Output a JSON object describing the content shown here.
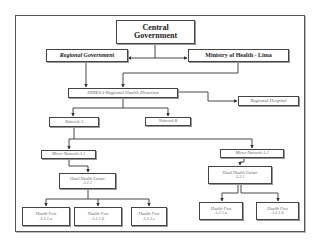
{
  "diagram": {
    "type": "organizational-hierarchy",
    "nodes": {
      "central_government": {
        "line1": "Central",
        "line2": "Government"
      },
      "regional_government": {
        "label": "Regional Government"
      },
      "ministry_of_health": {
        "label": "Ministry of Health - Lima"
      },
      "diresa": {
        "label": "DIRESA-Regional Health Direction"
      },
      "regional_hospital": {
        "label": "Regional Hospital"
      },
      "network_a": {
        "label": "Network A"
      },
      "network_b": {
        "label": "Network B"
      },
      "micro_network_a1": {
        "label": "Micro-Network A.1"
      },
      "micro_network_a2": {
        "label": "Micro-Network A.2"
      },
      "head_health_center_a11": {
        "line1": "Head Health Center",
        "line2": "A.1.1"
      },
      "head_health_center_a21": {
        "line1": "Head Health Center",
        "line2": "A.2.1"
      },
      "health_post_a11a": {
        "line1": "Health Post",
        "line2": "A.1.1.a"
      },
      "health_post_a11b": {
        "line1": "Health Post",
        "line2": "A.1.1.b"
      },
      "health_post_a11c": {
        "line1": "Health Post",
        "line2": "A.1.1.c"
      },
      "health_post_a21a": {
        "line1": "Health Post",
        "line2": "A.2.1.a"
      },
      "health_post_a21b": {
        "line1": "Health Post",
        "line2": "A.2.1.b"
      }
    },
    "edges": [
      [
        "central_government",
        "regional_government"
      ],
      [
        "central_government",
        "ministry_of_health"
      ],
      [
        "regional_government",
        "diresa"
      ],
      [
        "ministry_of_health",
        "diresa"
      ],
      [
        "diresa",
        "regional_hospital"
      ],
      [
        "diresa",
        "network_a"
      ],
      [
        "diresa",
        "network_b"
      ],
      [
        "network_a",
        "micro_network_a1"
      ],
      [
        "network_a",
        "micro_network_a2"
      ],
      [
        "micro_network_a1",
        "head_health_center_a11"
      ],
      [
        "micro_network_a2",
        "head_health_center_a21"
      ],
      [
        "head_health_center_a11",
        "health_post_a11a"
      ],
      [
        "head_health_center_a11",
        "health_post_a11b"
      ],
      [
        "head_health_center_a11",
        "health_post_a11c"
      ],
      [
        "head_health_center_a21",
        "health_post_a21a"
      ],
      [
        "head_health_center_a21",
        "health_post_a21b"
      ]
    ]
  }
}
